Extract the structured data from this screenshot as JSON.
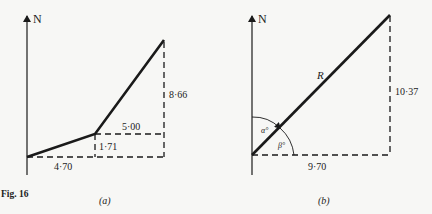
{
  "figure": {
    "caption": "Fig. 16",
    "panels": [
      {
        "id": "a",
        "label": "(a)",
        "north_label": "N",
        "segments": [
          {
            "name": "first-vector",
            "east": "4·70",
            "north": "1·71"
          },
          {
            "name": "second-vector",
            "east": "5·00",
            "north": "8·66"
          }
        ],
        "dimension_labels": {
          "horizontal_first": "4·70",
          "vertical_first": "1·71",
          "horizontal_second": "5·00",
          "vertical_second": "8·66"
        }
      },
      {
        "id": "b",
        "label": "(b)",
        "north_label": "N",
        "resultant_label": "R",
        "angle_from_north": "α°",
        "angle_from_east": "β°",
        "dimension_labels": {
          "horizontal": "9·70",
          "vertical": "10·37"
        }
      }
    ]
  },
  "colors": {
    "background": "#f7f7f5",
    "ink": "#1a1a1a"
  }
}
